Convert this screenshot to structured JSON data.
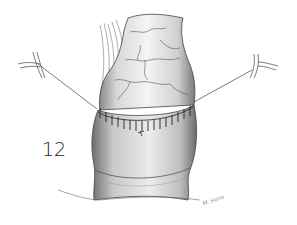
{
  "figure": {
    "number": "12",
    "signature": "M. Storm",
    "colors": {
      "background": "#ffffff",
      "line": "#333333",
      "shade": "#9a9a9a"
    }
  }
}
